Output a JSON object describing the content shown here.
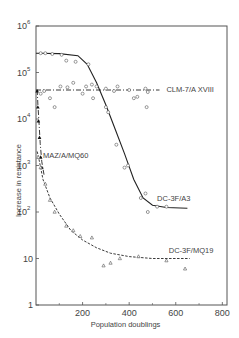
{
  "chart_data": {
    "type": "line",
    "title": "",
    "xlabel": "Population doublings",
    "ylabel": "Increase in resistance",
    "xlim": [
      0,
      820
    ],
    "ylim": [
      1,
      1000000
    ],
    "yscale": "log",
    "grid": false,
    "x_ticks": [
      200,
      400,
      600,
      800
    ],
    "x_tick_labels": [
      "200",
      "400",
      "600",
      "800"
    ],
    "y_ticks": [
      1,
      10,
      100,
      1000,
      10000,
      100000,
      1000000
    ],
    "y_tick_labels": [
      "1",
      "10",
      "10^2",
      "10^3",
      "10^4",
      "10^5",
      "10^6"
    ],
    "series": [
      {
        "name": "DC-3F/A3",
        "style": "solid",
        "marker": "circle-open",
        "curve": [
          [
            0,
            260000
          ],
          [
            100,
            255000
          ],
          [
            180,
            230000
          ],
          [
            220,
            150000
          ],
          [
            260,
            60000
          ],
          [
            300,
            20000
          ],
          [
            340,
            6000
          ],
          [
            380,
            1800
          ],
          [
            420,
            500
          ],
          [
            460,
            200
          ],
          [
            500,
            140
          ],
          [
            560,
            125
          ],
          [
            650,
            120
          ]
        ],
        "points": [
          [
            20,
            260000
          ],
          [
            40,
            260000
          ],
          [
            70,
            250000
          ],
          [
            110,
            240000
          ],
          [
            130,
            180000
          ],
          [
            170,
            170000
          ],
          [
            225,
            150000
          ],
          [
            240,
            55000
          ],
          [
            300,
            18000
          ],
          [
            310,
            14000
          ],
          [
            345,
            2800
          ],
          [
            380,
            900
          ],
          [
            395,
            1000
          ],
          [
            450,
            200
          ],
          [
            470,
            250
          ],
          [
            480,
            100
          ],
          [
            520,
            130
          ],
          [
            560,
            130
          ]
        ]
      },
      {
        "name": "CLM-7/A XVIII",
        "style": "dash-dot",
        "marker": "circle-open",
        "curve": [
          [
            0,
            42000
          ],
          [
            530,
            42000
          ]
        ],
        "points": [
          [
            20,
            35000
          ],
          [
            35,
            40000
          ],
          [
            60,
            28000
          ],
          [
            80,
            18000
          ],
          [
            105,
            50000
          ],
          [
            135,
            48000
          ],
          [
            160,
            60000
          ],
          [
            200,
            35000
          ],
          [
            215,
            50000
          ],
          [
            245,
            28000
          ],
          [
            260,
            50000
          ],
          [
            300,
            45000
          ],
          [
            335,
            40000
          ],
          [
            350,
            50000
          ],
          [
            400,
            42000
          ],
          [
            420,
            28000
          ],
          [
            435,
            30000
          ],
          [
            470,
            45000
          ],
          [
            475,
            18000
          ],
          [
            480,
            38000
          ]
        ]
      },
      {
        "name": "MAZ/A/MQ60",
        "style": "dash-dot",
        "marker": "triangle-filled",
        "curve": [
          [
            5,
            42000
          ],
          [
            8,
            20000
          ],
          [
            12,
            10000
          ],
          [
            18,
            3000
          ],
          [
            25,
            1200
          ],
          [
            35,
            600
          ]
        ],
        "points": [
          [
            5,
            40000
          ],
          [
            8,
            18000
          ],
          [
            10,
            9000
          ],
          [
            15,
            4000
          ],
          [
            20,
            1500
          ],
          [
            25,
            900
          ]
        ]
      },
      {
        "name": "DC-3F/MQ19",
        "style": "dashed",
        "marker": "triangle-open",
        "curve": [
          [
            5,
            2000
          ],
          [
            15,
            1200
          ],
          [
            30,
            500
          ],
          [
            60,
            200
          ],
          [
            100,
            90
          ],
          [
            150,
            40
          ],
          [
            200,
            25
          ],
          [
            260,
            17
          ],
          [
            320,
            13
          ],
          [
            400,
            11
          ],
          [
            500,
            10
          ],
          [
            600,
            10
          ],
          [
            660,
            10
          ]
        ],
        "points": [
          [
            10,
            1500
          ],
          [
            20,
            900
          ],
          [
            40,
            400
          ],
          [
            60,
            180
          ],
          [
            80,
            100
          ],
          [
            130,
            50
          ],
          [
            160,
            40
          ],
          [
            190,
            30
          ],
          [
            240,
            28
          ],
          [
            290,
            7
          ],
          [
            320,
            8
          ],
          [
            360,
            10
          ],
          [
            440,
            11
          ],
          [
            560,
            9
          ],
          [
            640,
            6
          ]
        ]
      }
    ],
    "annotations": [
      {
        "text": "CLM-7/A XVIII",
        "x": 560,
        "y": 45000
      },
      {
        "text": "MAZ/A/MQ60",
        "x": 30,
        "y": 1700
      },
      {
        "text": "DC-3F/A3",
        "x": 520,
        "y": 200
      },
      {
        "text": "DC-3F/MQ19",
        "x": 570,
        "y": 15
      }
    ]
  }
}
